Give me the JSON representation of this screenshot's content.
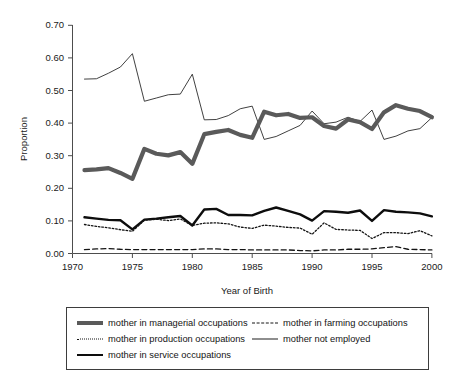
{
  "chart_data": {
    "type": "line",
    "title": "",
    "xlabel": "Year of Birth",
    "ylabel": "Proportion",
    "xlim": [
      1970,
      2000
    ],
    "ylim": [
      0.0,
      0.7
    ],
    "xticks": [
      "1970",
      "1975",
      "1980",
      "1985",
      "1990",
      "1995",
      "2000"
    ],
    "yticks": [
      "0.00",
      "0.10",
      "0.20",
      "0.30",
      "0.40",
      "0.50",
      "0.60",
      "0.70"
    ],
    "grid": false,
    "legend_position": "below-plot",
    "x": [
      1971,
      1972,
      1973,
      1974,
      1975,
      1976,
      1977,
      1978,
      1979,
      1980,
      1981,
      1982,
      1983,
      1984,
      1985,
      1986,
      1987,
      1988,
      1989,
      1990,
      1991,
      1992,
      1993,
      1994,
      1995,
      1996,
      1997,
      1998,
      1999,
      2000
    ],
    "series": [
      {
        "name": "mother in managerial occupations",
        "style": "thick-gray-solid",
        "color": "#5a5a5a",
        "values": [
          0.256,
          0.258,
          0.262,
          0.247,
          0.229,
          0.321,
          0.306,
          0.301,
          0.311,
          0.275,
          0.366,
          0.373,
          0.379,
          0.364,
          0.355,
          0.435,
          0.424,
          0.428,
          0.416,
          0.418,
          0.391,
          0.383,
          0.411,
          0.403,
          0.382,
          0.433,
          0.455,
          0.444,
          0.437,
          0.418
        ]
      },
      {
        "name": "mother in production occupations",
        "style": "dotted",
        "color": "#141414",
        "values": [
          0.089,
          0.083,
          0.079,
          0.073,
          0.068,
          0.102,
          0.105,
          0.101,
          0.106,
          0.086,
          0.093,
          0.094,
          0.091,
          0.081,
          0.077,
          0.087,
          0.084,
          0.08,
          0.078,
          0.059,
          0.094,
          0.074,
          0.072,
          0.071,
          0.046,
          0.064,
          0.064,
          0.061,
          0.07,
          0.054
        ]
      },
      {
        "name": "mother in service occupations",
        "style": "thick-black-solid",
        "color": "#0d0d0d",
        "values": [
          0.111,
          0.107,
          0.103,
          0.102,
          0.074,
          0.104,
          0.107,
          0.111,
          0.115,
          0.086,
          0.135,
          0.137,
          0.118,
          0.118,
          0.117,
          0.131,
          0.141,
          0.131,
          0.12,
          0.101,
          0.13,
          0.128,
          0.125,
          0.132,
          0.1,
          0.133,
          0.128,
          0.126,
          0.123,
          0.114
        ]
      },
      {
        "name": "mother in farming occupations",
        "style": "dashed",
        "color": "#141414",
        "values": [
          0.012,
          0.014,
          0.015,
          0.013,
          0.012,
          0.012,
          0.012,
          0.012,
          0.012,
          0.012,
          0.014,
          0.014,
          0.012,
          0.012,
          0.011,
          0.011,
          0.011,
          0.011,
          0.009,
          0.008,
          0.011,
          0.011,
          0.013,
          0.013,
          0.014,
          0.018,
          0.021,
          0.013,
          0.012,
          0.011
        ]
      },
      {
        "name": "mother not employed",
        "style": "thin-solid",
        "color": "#1f1f1f",
        "values": [
          0.535,
          0.536,
          0.553,
          0.572,
          0.613,
          0.467,
          0.477,
          0.487,
          0.489,
          0.55,
          0.41,
          0.411,
          0.423,
          0.444,
          0.452,
          0.35,
          0.359,
          0.376,
          0.393,
          0.437,
          0.398,
          0.403,
          0.418,
          0.405,
          0.44,
          0.35,
          0.36,
          0.376,
          0.383,
          0.417
        ]
      }
    ]
  },
  "legend": {
    "entries": [
      {
        "label": "mother in managerial occupations",
        "swatch": "thick-gray-line-icon"
      },
      {
        "label": "mother in farming occupations",
        "swatch": "dashed-line-icon"
      },
      {
        "label": "mother in production occupations",
        "swatch": "dotted-line-icon"
      },
      {
        "label": "mother not employed",
        "swatch": "thin-line-icon"
      },
      {
        "label": "mother in service occupations",
        "swatch": "thick-black-line-icon"
      }
    ]
  },
  "axes": {
    "y_label": "Proportion",
    "x_label": "Year of Birth",
    "y_tick_0": "0.00",
    "y_tick_1": "0.10",
    "y_tick_2": "0.20",
    "y_tick_3": "0.30",
    "y_tick_4": "0.40",
    "y_tick_5": "0.50",
    "y_tick_6": "0.60",
    "y_tick_7": "0.70",
    "x_tick_0": "1970",
    "x_tick_1": "1975",
    "x_tick_2": "1980",
    "x_tick_3": "1985",
    "x_tick_4": "1990",
    "x_tick_5": "1995",
    "x_tick_6": "2000"
  }
}
